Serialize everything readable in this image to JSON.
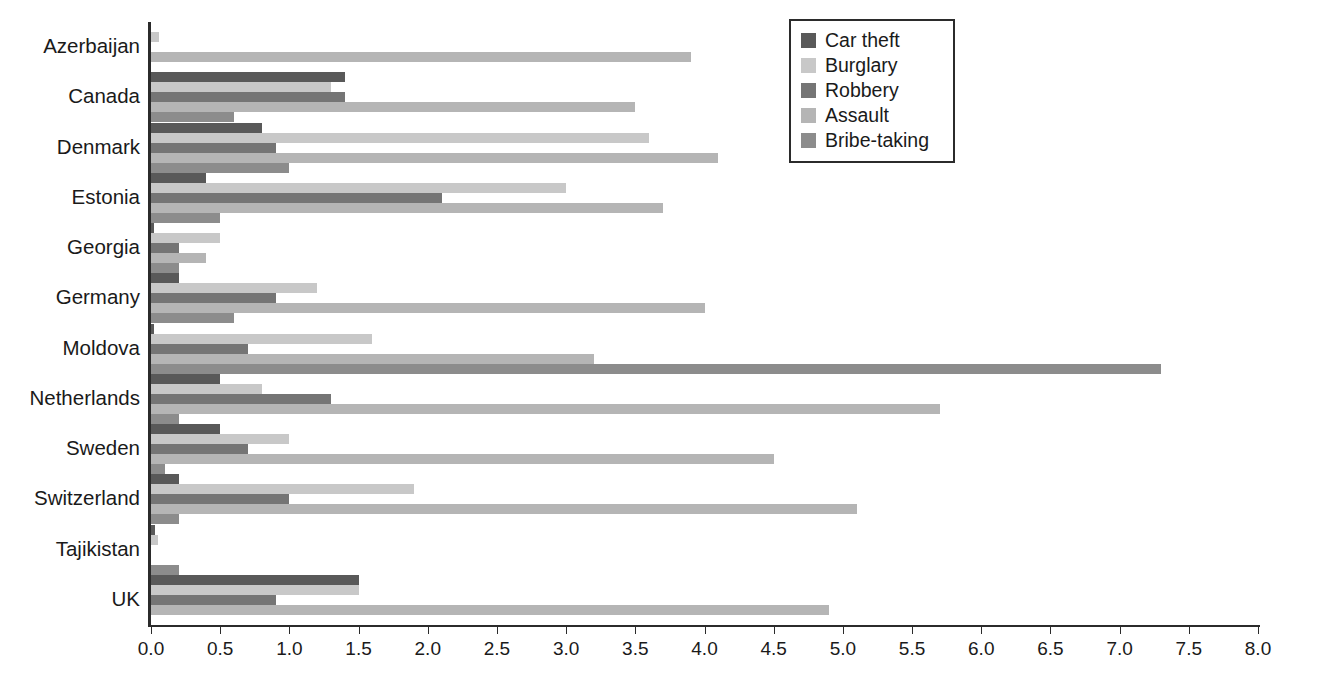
{
  "chart_data": {
    "type": "bar",
    "orientation": "horizontal",
    "title": "",
    "subtitle": "",
    "xlabel": "",
    "ylabel": "",
    "xlim": [
      0.0,
      8.0
    ],
    "xticks": [
      "0.0",
      "0.5",
      "1.0",
      "1.5",
      "2.0",
      "2.5",
      "3.0",
      "3.5",
      "4.0",
      "4.5",
      "5.0",
      "5.5",
      "6.0",
      "6.5",
      "7.0",
      "7.5",
      "8.0"
    ],
    "xtick_values": [
      0.0,
      0.5,
      1.0,
      1.5,
      2.0,
      2.5,
      3.0,
      3.5,
      4.0,
      4.5,
      5.0,
      5.5,
      6.0,
      6.5,
      7.0,
      7.5,
      8.0
    ],
    "grid": false,
    "legend_position": "top-right",
    "categories": [
      "Azerbaijan",
      "Canada",
      "Denmark",
      "Estonia",
      "Georgia",
      "Germany",
      "Moldova",
      "Netherlands",
      "Sweden",
      "Switzerland",
      "Tajikistan",
      "UK"
    ],
    "series": [
      {
        "name": "Car theft",
        "color": "#595959",
        "values": [
          0.0,
          1.4,
          0.8,
          0.4,
          0.02,
          0.2,
          0.02,
          0.5,
          0.5,
          0.2,
          0.03,
          1.5
        ]
      },
      {
        "name": "Burglary",
        "color": "#c8c8c8",
        "values": [
          0.06,
          1.3,
          3.6,
          3.0,
          0.5,
          1.2,
          1.6,
          0.8,
          1.0,
          1.9,
          0.05,
          1.5
        ]
      },
      {
        "name": "Robbery",
        "color": "#757575",
        "values": [
          0.0,
          1.4,
          0.9,
          2.1,
          0.2,
          0.9,
          0.7,
          1.3,
          0.7,
          1.0,
          0.0,
          0.9
        ]
      },
      {
        "name": "Assault",
        "color": "#b5b5b5",
        "values": [
          3.9,
          3.5,
          4.1,
          3.7,
          0.4,
          4.0,
          3.2,
          5.7,
          4.5,
          5.1,
          0.0,
          4.9
        ]
      },
      {
        "name": "Bribe-taking",
        "color": "#8c8c8c",
        "values": [
          0.0,
          0.6,
          1.0,
          0.5,
          0.2,
          0.6,
          7.3,
          0.2,
          0.1,
          0.2,
          0.2,
          0.0
        ]
      }
    ]
  },
  "legend": {
    "items": [
      {
        "label": "Car theft",
        "swatch": "#595959"
      },
      {
        "label": "Burglary",
        "swatch": "#c8c8c8"
      },
      {
        "label": "Robbery",
        "swatch": "#757575"
      },
      {
        "label": "Assault",
        "swatch": "#b5b5b5"
      },
      {
        "label": "Bribe-taking",
        "swatch": "#8c8c8c"
      }
    ]
  },
  "axis": {
    "y_line_color": "#2b2b2b",
    "x_line_color": "#2b2b2b"
  }
}
